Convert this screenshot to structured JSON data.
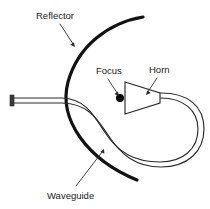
{
  "figure": {
    "type": "technical-diagram",
    "background_color": "#ffffff",
    "width": 210,
    "height": 209
  },
  "colors": {
    "reflector_stroke": "#121212",
    "waveguide_stroke": "#2b2b2b",
    "label_text": "#1a1a1a",
    "focus_dot": "#000000",
    "leader_line": "#2b2b2b"
  },
  "labels": [
    {
      "id": "reflector",
      "text": "Reflector",
      "text_x": 36,
      "text_y": 19,
      "leader_from_x": 60,
      "leader_from_y": 24,
      "leader_to_x": 75,
      "leader_to_y": 47,
      "arrow_angle_deg": 57
    },
    {
      "id": "focus",
      "text": "Focus",
      "text_x": 96,
      "text_y": 74,
      "leader_from_x": 108,
      "leader_from_y": 79,
      "leader_to_x": 119,
      "leader_to_y": 96,
      "arrow_angle_deg": 57
    },
    {
      "id": "horn",
      "text": "Horn",
      "text_x": 149,
      "text_y": 73,
      "leader_from_x": 157,
      "leader_from_y": 78,
      "leader_to_x": 146,
      "leader_to_y": 95,
      "arrow_angle_deg": 123
    },
    {
      "id": "waveguide",
      "text": "Waveguide",
      "text_x": 47,
      "text_y": 199,
      "leader_from_x": 76,
      "leader_from_y": 186,
      "leader_to_x": 104,
      "leader_to_y": 149,
      "arrow_angle_deg": -53
    }
  ],
  "geometry": {
    "reflector_path": "M 143 17 C 108 23 78 46 68 82 C 58 120 88 160 137 180",
    "waveguide_outer_path": "M 13 98 L 62 98 C 84 99 92 112 104 131 C 118 153 135 162 160 162 C 183 162 198 149 198 129 C 198 110 183 98 161 98 L 144 98",
    "waveguide_inner_path": "M 13 103 L 62 103 C 88 104 96 117 108 135 C 121 155 136 167 161 167 C 188 167 204 151 204 129 C 204 106 188 93 161 93 L 144 93",
    "horn_polygon": "125,82 125,114 160,103 160,93",
    "horn_aperture_x": 125,
    "focus_dot_x": 120,
    "focus_dot_y": 98,
    "focus_dot_r": 4.0,
    "flange_x": 10,
    "flange_y": 95,
    "flange_w": 4,
    "flange_h": 11
  }
}
